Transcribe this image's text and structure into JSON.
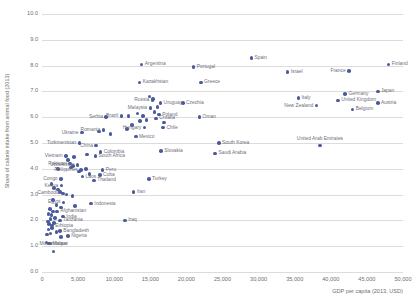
{
  "chart_data": {
    "type": "scatter",
    "title": "",
    "xlabel": "GDP per capita (2013, USD)",
    "ylabel": "Share of calorie intake from animal food (2013)",
    "xlim": [
      0,
      50000
    ],
    "ylim": [
      0,
      10
    ],
    "xticks": [
      "0",
      "5,000",
      "10,000",
      "15,000",
      "20,000",
      "25,000",
      "30,000",
      "35,000",
      "40,000",
      "45,000",
      "50,000"
    ],
    "xtick_values": [
      0,
      5000,
      10000,
      15000,
      20000,
      25000,
      30000,
      35000,
      40000,
      45000,
      50000
    ],
    "yticks": [
      "0.0",
      "1.0",
      "2.0",
      "3.0",
      "4.0",
      "5.0",
      "6.0",
      "7.0",
      "8.0",
      "9.0",
      "10.0"
    ],
    "ytick_values": [
      0,
      1,
      2,
      3,
      4,
      5,
      6,
      7,
      8,
      9,
      10
    ],
    "grid": "horizontal",
    "legend": "none",
    "marker_color": "#4a5a9b",
    "label_color": "#6e6e7a",
    "grid_color": "#dcdcdc",
    "points": [
      {
        "name": "Finland",
        "x": 48000,
        "y": 8.05,
        "side": "r"
      },
      {
        "name": "France",
        "x": 42500,
        "y": 7.8,
        "side": "l"
      },
      {
        "name": "Spain",
        "x": 29000,
        "y": 8.3,
        "side": "r"
      },
      {
        "name": "Israel",
        "x": 34000,
        "y": 7.75,
        "side": "r"
      },
      {
        "name": "Portugal",
        "x": 21000,
        "y": 7.95,
        "side": "r"
      },
      {
        "name": "Argentina",
        "x": 13800,
        "y": 8.05,
        "side": "r"
      },
      {
        "name": "Greece",
        "x": 22000,
        "y": 7.35,
        "side": "r"
      },
      {
        "name": "Kazakhstan",
        "x": 13500,
        "y": 7.35,
        "side": "r"
      },
      {
        "name": "Japan",
        "x": 46500,
        "y": 7.0,
        "side": "r"
      },
      {
        "name": "Germany",
        "x": 42000,
        "y": 6.9,
        "side": "r"
      },
      {
        "name": "Italy",
        "x": 35500,
        "y": 6.75,
        "side": "r"
      },
      {
        "name": "United Kingdom",
        "x": 41000,
        "y": 6.65,
        "side": "r"
      },
      {
        "name": "Austria",
        "x": 46500,
        "y": 6.55,
        "side": "r"
      },
      {
        "name": "Czechia",
        "x": 19500,
        "y": 6.55,
        "side": "r"
      },
      {
        "name": "Uruguay",
        "x": 16400,
        "y": 6.55,
        "side": "r"
      },
      {
        "name": "Russia",
        "x": 15300,
        "y": 6.65,
        "side": "l"
      },
      {
        "name": "Malaysia",
        "x": 15000,
        "y": 6.35,
        "side": "l"
      },
      {
        "name": "New Zealand",
        "x": 38000,
        "y": 6.45,
        "side": "l"
      },
      {
        "name": "Belgium",
        "x": 43000,
        "y": 6.3,
        "side": "r"
      },
      {
        "name": "Brazil",
        "x": 11000,
        "y": 6.05,
        "side": "l"
      },
      {
        "name": "Serbia",
        "x": 8900,
        "y": 6.0,
        "side": "l"
      },
      {
        "name": "Finland2",
        "x": 14000,
        "y": 6.05,
        "side": "none"
      },
      {
        "name": "Poland",
        "x": 16200,
        "y": 6.1,
        "side": "r"
      },
      {
        "name": "Croatia",
        "x": 15800,
        "y": 5.95,
        "side": "r"
      },
      {
        "name": "Oman",
        "x": 21800,
        "y": 6.0,
        "side": "r"
      },
      {
        "name": "Ukraine",
        "x": 5500,
        "y": 5.4,
        "side": "l"
      },
      {
        "name": "Romania",
        "x": 8500,
        "y": 5.5,
        "side": "l"
      },
      {
        "name": "Hungary",
        "x": 14200,
        "y": 5.6,
        "side": "l"
      },
      {
        "name": "Chile",
        "x": 16800,
        "y": 5.6,
        "side": "r"
      },
      {
        "name": "Mexico",
        "x": 13000,
        "y": 5.25,
        "side": "r"
      },
      {
        "name": "South Korea",
        "x": 24500,
        "y": 5.0,
        "side": "r"
      },
      {
        "name": "United Arab Emirates",
        "x": 38500,
        "y": 4.9,
        "side": "c"
      },
      {
        "name": "Turkmenistan",
        "x": 5200,
        "y": 5.0,
        "side": "l"
      },
      {
        "name": "China",
        "x": 7500,
        "y": 4.9,
        "side": "l"
      },
      {
        "name": "Slovakia",
        "x": 16500,
        "y": 4.7,
        "side": "r"
      },
      {
        "name": "Saudi Arabia",
        "x": 24000,
        "y": 4.6,
        "side": "r"
      },
      {
        "name": "Colombia",
        "x": 8100,
        "y": 4.65,
        "side": "r"
      },
      {
        "name": "South Africa",
        "x": 7400,
        "y": 4.5,
        "side": "r"
      },
      {
        "name": "Vietnam",
        "x": 3300,
        "y": 4.5,
        "side": "l"
      },
      {
        "name": "Pakistan",
        "x": 3900,
        "y": 4.2,
        "side": "l"
      },
      {
        "name": "Uzbekistan",
        "x": 4900,
        "y": 4.15,
        "side": "l"
      },
      {
        "name": "Philippines",
        "x": 5400,
        "y": 3.95,
        "side": "l"
      },
      {
        "name": "Peru",
        "x": 8400,
        "y": 3.95,
        "side": "r"
      },
      {
        "name": "Cuba",
        "x": 8000,
        "y": 3.75,
        "side": "r"
      },
      {
        "name": "Laos",
        "x": 5600,
        "y": 3.7,
        "side": "r"
      },
      {
        "name": "Thailand",
        "x": 7200,
        "y": 3.55,
        "side": "r"
      },
      {
        "name": "Congo",
        "x": 2600,
        "y": 3.6,
        "side": "l"
      },
      {
        "name": "Kenya",
        "x": 2700,
        "y": 3.35,
        "side": "l"
      },
      {
        "name": "Turkey",
        "x": 14800,
        "y": 3.6,
        "side": "r"
      },
      {
        "name": "Cambodia",
        "x": 2900,
        "y": 3.05,
        "side": "l"
      },
      {
        "name": "Iran",
        "x": 12700,
        "y": 3.1,
        "side": "r"
      },
      {
        "name": "Egypt",
        "x": 3000,
        "y": 2.7,
        "side": "l"
      },
      {
        "name": "Indonesia",
        "x": 6800,
        "y": 2.65,
        "side": "r"
      },
      {
        "name": "Afghanistan",
        "x": 2100,
        "y": 2.35,
        "side": "r"
      },
      {
        "name": "India",
        "x": 2900,
        "y": 2.15,
        "side": "r"
      },
      {
        "name": "Tanzania",
        "x": 2500,
        "y": 2.0,
        "side": "r"
      },
      {
        "name": "Iraq",
        "x": 11500,
        "y": 2.0,
        "side": "r"
      },
      {
        "name": "Ethiopia",
        "x": 1400,
        "y": 1.8,
        "side": "r"
      },
      {
        "name": "Bangladesh",
        "x": 2500,
        "y": 1.6,
        "side": "r"
      },
      {
        "name": "Nigeria",
        "x": 3600,
        "y": 1.4,
        "side": "r"
      },
      {
        "name": "Malawi",
        "x": 1000,
        "y": 1.1,
        "side": "r"
      },
      {
        "name": "Mozambique",
        "x": 1600,
        "y": 0.8,
        "side": "c"
      }
    ],
    "extra_points": [
      {
        "x": 1300,
        "y": 3.4
      },
      {
        "x": 1700,
        "y": 3.25
      },
      {
        "x": 2200,
        "y": 3.2
      },
      {
        "x": 2500,
        "y": 3.1
      },
      {
        "x": 3400,
        "y": 3.0
      },
      {
        "x": 4200,
        "y": 2.95
      },
      {
        "x": 1500,
        "y": 2.8
      },
      {
        "x": 2000,
        "y": 2.6
      },
      {
        "x": 2600,
        "y": 2.5
      },
      {
        "x": 4600,
        "y": 2.55
      },
      {
        "x": 1100,
        "y": 2.45
      },
      {
        "x": 1500,
        "y": 2.35
      },
      {
        "x": 900,
        "y": 2.25
      },
      {
        "x": 1300,
        "y": 2.2
      },
      {
        "x": 1800,
        "y": 2.1
      },
      {
        "x": 1200,
        "y": 2.05
      },
      {
        "x": 800,
        "y": 1.95
      },
      {
        "x": 1700,
        "y": 1.9
      },
      {
        "x": 1000,
        "y": 1.85
      },
      {
        "x": 1400,
        "y": 1.7
      },
      {
        "x": 900,
        "y": 1.65
      },
      {
        "x": 2000,
        "y": 1.55
      },
      {
        "x": 1200,
        "y": 1.5
      },
      {
        "x": 700,
        "y": 1.45
      },
      {
        "x": 2600,
        "y": 1.35
      },
      {
        "x": 600,
        "y": 1.15
      },
      {
        "x": 1100,
        "y": 1.1
      },
      {
        "x": 4300,
        "y": 4.1
      },
      {
        "x": 4000,
        "y": 4.05
      },
      {
        "x": 5100,
        "y": 3.9
      },
      {
        "x": 6100,
        "y": 4.0
      },
      {
        "x": 6600,
        "y": 3.8
      },
      {
        "x": 3600,
        "y": 4.35
      },
      {
        "x": 4400,
        "y": 4.45
      },
      {
        "x": 6200,
        "y": 4.55
      },
      {
        "x": 9500,
        "y": 5.35
      },
      {
        "x": 7900,
        "y": 5.45
      },
      {
        "x": 11800,
        "y": 5.55
      },
      {
        "x": 12500,
        "y": 5.7
      },
      {
        "x": 13200,
        "y": 6.15
      },
      {
        "x": 15600,
        "y": 6.2
      },
      {
        "x": 16000,
        "y": 6.4
      },
      {
        "x": 14500,
        "y": 5.9
      },
      {
        "x": 13600,
        "y": 5.85
      },
      {
        "x": 12000,
        "y": 6.05
      },
      {
        "x": 16900,
        "y": 5.8
      },
      {
        "x": 15400,
        "y": 6.7
      },
      {
        "x": 14900,
        "y": 6.8
      },
      {
        "x": 2200,
        "y": 4.0
      }
    ]
  }
}
